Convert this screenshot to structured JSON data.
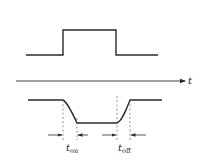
{
  "diagram": {
    "axis": {
      "label": "t"
    },
    "input_pulse": {
      "description": "Ideal rectangular input pulse",
      "low_level_y": 55,
      "high_level_y": 30,
      "x_start": 26,
      "x_rise": 63,
      "x_fall": 116,
      "x_end": 158
    },
    "output_waveform": {
      "description": "Inverted output with finite switching times",
      "high_level_y": 100,
      "low_level_y": 123,
      "x_start": 28,
      "x_fall_start": 63,
      "x_fall_end": 77,
      "x_rise_start": 117,
      "x_rise_end": 130,
      "x_end": 162
    },
    "labels": {
      "t_on": {
        "main": "t",
        "sub": "on"
      },
      "t_off": {
        "main": "t",
        "sub": "off"
      }
    },
    "colors": {
      "stroke": "#2a2a2a",
      "dash": "#555555",
      "background": "#ffffff"
    }
  }
}
